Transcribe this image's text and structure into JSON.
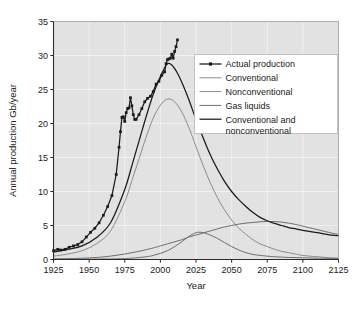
{
  "chart_data": {
    "type": "line",
    "title": "",
    "xlabel": "Year",
    "ylabel": "Annual production Gb/year",
    "xlim": [
      1925,
      2125
    ],
    "ylim": [
      0,
      35
    ],
    "xticks": [
      1925,
      1950,
      1975,
      2000,
      2025,
      2050,
      2075,
      2100,
      2125
    ],
    "yticks": [
      0,
      5,
      10,
      15,
      20,
      25,
      30,
      35
    ],
    "grid": true,
    "legend_position": "upper right",
    "plot_background": "#e2e2e2",
    "figure_background": "#ffffff",
    "series": [
      {
        "name": "Actual production",
        "color": "#1a1a1a",
        "marker": "square",
        "x": [
          1925,
          1928,
          1930,
          1933,
          1936,
          1939,
          1942,
          1945,
          1948,
          1951,
          1954,
          1957,
          1960,
          1963,
          1966,
          1969,
          1971,
          1972,
          1973,
          1974,
          1975,
          1976,
          1977,
          1978,
          1979,
          1980,
          1981,
          1982,
          1983,
          1985,
          1987,
          1989,
          1991,
          1993,
          1995,
          1997,
          1999,
          2001,
          2003,
          2004,
          2005,
          2006,
          2007,
          2008,
          2009,
          2010,
          2011,
          2012
        ],
        "y": [
          1.3,
          1.5,
          1.4,
          1.5,
          1.8,
          2.0,
          2.2,
          2.6,
          3.3,
          4.0,
          4.6,
          5.4,
          6.5,
          7.8,
          9.4,
          12.5,
          16.5,
          18.8,
          20.9,
          21.0,
          20.3,
          21.6,
          22.2,
          22.3,
          23.8,
          22.6,
          21.3,
          20.6,
          20.6,
          21.3,
          22.2,
          23.2,
          23.7,
          24.0,
          24.7,
          25.8,
          26.2,
          27.1,
          27.6,
          28.8,
          29.4,
          29.5,
          29.6,
          30.2,
          29.6,
          30.6,
          31.3,
          32.3
        ]
      },
      {
        "name": "Conventional",
        "color": "#8c8c8c",
        "marker": "none",
        "peak_year": 2005,
        "peak_value": 23.6,
        "x": [
          1925,
          1935,
          1945,
          1955,
          1965,
          1975,
          1980,
          1985,
          1990,
          1995,
          2000,
          2005,
          2010,
          2015,
          2020,
          2025,
          2030,
          2035,
          2040,
          2045,
          2050,
          2055,
          2060,
          2065,
          2070,
          2075,
          2080,
          2085,
          2090,
          2095,
          2100,
          2110,
          2120,
          2125
        ],
        "y": [
          0.5,
          0.8,
          1.3,
          2.3,
          4.2,
          8.5,
          11.6,
          14.8,
          18.0,
          20.8,
          22.7,
          23.6,
          23.2,
          21.7,
          19.4,
          16.6,
          13.8,
          11.3,
          9.1,
          7.3,
          5.8,
          4.6,
          3.7,
          2.9,
          2.3,
          1.9,
          1.5,
          1.2,
          1.0,
          0.8,
          0.6,
          0.4,
          0.25,
          0.2
        ]
      },
      {
        "name": "Nonconventional",
        "color": "#6e6e6e",
        "marker": "none",
        "peak_year": 2027,
        "peak_value": 4.0,
        "x": [
          1925,
          1950,
          1970,
          1980,
          1990,
          1995,
          2000,
          2005,
          2010,
          2015,
          2020,
          2025,
          2027,
          2030,
          2035,
          2040,
          2045,
          2050,
          2055,
          2060,
          2065,
          2070,
          2080,
          2090,
          2100,
          2110,
          2125
        ],
        "y": [
          0.0,
          0.05,
          0.1,
          0.2,
          0.4,
          0.6,
          0.9,
          1.3,
          1.9,
          2.6,
          3.4,
          3.95,
          4.0,
          3.95,
          3.6,
          3.1,
          2.5,
          1.9,
          1.4,
          1.0,
          0.75,
          0.6,
          0.4,
          0.3,
          0.25,
          0.2,
          0.15
        ]
      },
      {
        "name": "Gas liquids",
        "color": "#6e6e6e",
        "marker": "none",
        "peak_year": 2075,
        "peak_value": 5.6,
        "x": [
          1925,
          1940,
          1955,
          1965,
          1975,
          1985,
          1995,
          2000,
          2005,
          2010,
          2015,
          2020,
          2025,
          2030,
          2035,
          2040,
          2045,
          2050,
          2055,
          2060,
          2065,
          2070,
          2075,
          2080,
          2085,
          2090,
          2095,
          2100,
          2110,
          2120,
          2125
        ],
        "y": [
          0.1,
          0.15,
          0.3,
          0.5,
          0.8,
          1.2,
          1.7,
          2.0,
          2.3,
          2.6,
          2.9,
          3.3,
          3.6,
          3.9,
          4.2,
          4.5,
          4.8,
          5.0,
          5.2,
          5.35,
          5.45,
          5.55,
          5.6,
          5.58,
          5.5,
          5.35,
          5.15,
          4.9,
          4.4,
          3.9,
          3.7
        ]
      },
      {
        "name": "Conventional and nonconventional",
        "color": "#1a1a1a",
        "marker": "none",
        "peak_year": 2005,
        "peak_value": 28.8,
        "x": [
          1925,
          1935,
          1945,
          1955,
          1965,
          1975,
          1980,
          1985,
          1990,
          1995,
          2000,
          2003,
          2005,
          2008,
          2012,
          2016,
          2020,
          2025,
          2030,
          2035,
          2040,
          2045,
          2050,
          2055,
          2060,
          2065,
          2070,
          2075,
          2080,
          2085,
          2090,
          2095,
          2100,
          2110,
          2120,
          2125
        ],
        "y": [
          1.1,
          1.5,
          2.0,
          3.2,
          5.4,
          10.3,
          13.8,
          17.4,
          21.0,
          24.3,
          26.9,
          28.2,
          28.8,
          28.6,
          27.4,
          25.6,
          23.5,
          20.6,
          17.9,
          15.4,
          13.3,
          11.5,
          10.0,
          8.8,
          7.8,
          6.9,
          6.2,
          5.7,
          5.3,
          5.0,
          4.7,
          4.5,
          4.3,
          3.95,
          3.6,
          3.5
        ]
      }
    ]
  },
  "legend": {
    "items": [
      {
        "label": "Actual production",
        "color": "#1a1a1a",
        "marker": "square"
      },
      {
        "label": "Conventional",
        "color": "#8c8c8c",
        "marker": "none"
      },
      {
        "label": "Nonconventional",
        "color": "#8c8c8c",
        "marker": "none"
      },
      {
        "label": "Gas liquids",
        "color": "#6e6e6e",
        "marker": "none"
      },
      {
        "label": "Conventional and",
        "label2": "nonconventional",
        "color": "#1a1a1a",
        "marker": "none"
      }
    ]
  },
  "axes": {
    "xlabel": "Year",
    "ylabel": "Annual production Gb/year",
    "xticklabels": [
      "1925",
      "1950",
      "1975",
      "2000",
      "2025",
      "2050",
      "2075",
      "2100",
      "2125"
    ],
    "yticklabels": [
      "0",
      "5",
      "10",
      "15",
      "20",
      "25",
      "30",
      "35"
    ]
  }
}
